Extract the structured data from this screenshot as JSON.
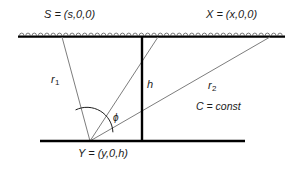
{
  "figure": {
    "type": "geometry-diagram",
    "background_color": "#ffffff",
    "line_color": "#000000",
    "ray_color": "#808080",
    "text_color": "#1a1a1a"
  },
  "labels": {
    "source_point": "S = (s,0,0)",
    "receiver_point": "X = (x,0,0)",
    "scatterer_point": "Y = (y,0,h)",
    "ray_one": "r",
    "ray_one_sub": "1",
    "ray_two": "r",
    "ray_two_sub": "2",
    "depth": "h",
    "angle": "ϕ",
    "velocity": "C = const"
  },
  "geometry": {
    "surface_line": {
      "x1": 18,
      "y1": 36,
      "x2": 285,
      "y2": 36,
      "hatch_count": 42
    },
    "reflector_line": {
      "x1": 40,
      "y1": 141,
      "x2": 245,
      "y2": 141
    },
    "depth_line": {
      "x": 142,
      "y1": 36,
      "y2": 141
    },
    "vertex": {
      "x": 90,
      "y": 141
    },
    "ray_one_top": {
      "x": 62,
      "y": 37
    },
    "ray_mid_top": {
      "x": 158,
      "y": 37
    },
    "ray_two_top": {
      "x": 270,
      "y": 37
    },
    "angle_arc_radius": 26
  }
}
